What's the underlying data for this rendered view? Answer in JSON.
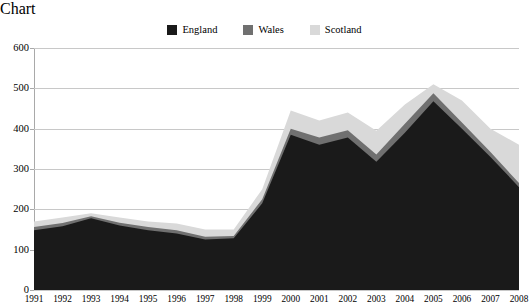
{
  "chart_data": {
    "type": "area",
    "stacked": true,
    "title": "",
    "subtitle": "",
    "xlabel": "",
    "ylabel": "",
    "ylim": [
      0,
      600
    ],
    "ytick_values": [
      0,
      100,
      200,
      300,
      400,
      500,
      600
    ],
    "ytick_labels": [
      "0",
      "100",
      "200",
      "300",
      "400",
      "500",
      "600"
    ],
    "grid": true,
    "legend_position": "top-center",
    "categories": [
      "1991",
      "1992",
      "1993",
      "1994",
      "1995",
      "1996",
      "1997",
      "1998",
      "1999",
      "2000",
      "2001",
      "2002",
      "2003",
      "2004",
      "2005",
      "2006",
      "2007",
      "2008"
    ],
    "series": [
      {
        "name": "England",
        "color": "#1a1a1a",
        "values": [
          148,
          158,
          178,
          160,
          148,
          140,
          125,
          128,
          215,
          385,
          360,
          378,
          318,
          390,
          468,
          400,
          330,
          255
        ]
      },
      {
        "name": "Wales",
        "color": "#707070",
        "values": [
          8,
          8,
          5,
          7,
          8,
          8,
          7,
          6,
          10,
          15,
          18,
          18,
          18,
          22,
          20,
          15,
          12,
          10
        ]
      },
      {
        "name": "Scotland",
        "color": "#d9d9d9",
        "values": [
          14,
          14,
          7,
          13,
          14,
          17,
          18,
          16,
          25,
          45,
          42,
          44,
          59,
          48,
          22,
          55,
          58,
          95
        ]
      }
    ],
    "totals": [
      170,
      180,
      190,
      180,
      170,
      165,
      150,
      150,
      250,
      445,
      420,
      440,
      395,
      460,
      510,
      470,
      400,
      360
    ]
  },
  "legend": {
    "items": [
      {
        "label": "England",
        "color": "#1a1a1a"
      },
      {
        "label": "Wales",
        "color": "#707070"
      },
      {
        "label": "Scotland",
        "color": "#d9d9d9"
      }
    ]
  },
  "axes": {
    "y": {
      "ticks": [
        "600",
        "500",
        "400",
        "300",
        "200",
        "100",
        "0"
      ]
    },
    "x": {
      "ticks": [
        "1991",
        "1992",
        "1993",
        "1994",
        "1995",
        "1996",
        "1997",
        "1998",
        "1999",
        "2000",
        "2001",
        "2002",
        "2003",
        "2004",
        "2005",
        "2006",
        "2007",
        "2008"
      ]
    }
  },
  "colors": {
    "grid": "#c8c8c8",
    "axis": "#a9a9a9",
    "background": "#ffffff"
  }
}
